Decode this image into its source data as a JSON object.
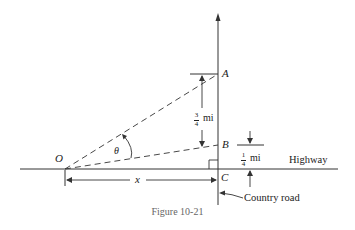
{
  "figure": {
    "caption": "Figure 10-21",
    "points": {
      "A": "A",
      "B": "B",
      "C": "C",
      "O": "O"
    },
    "angle_label": "θ",
    "distance_x_label": "x",
    "dist_AB": {
      "numerator": "3",
      "denominator": "4",
      "unit": "mi"
    },
    "dist_BC": {
      "numerator": "1",
      "denominator": "4",
      "unit": "mi"
    },
    "road_labels": {
      "highway": "Highway",
      "country_road": "Country road"
    },
    "colors": {
      "line": "#333333",
      "caption": "#666666"
    }
  }
}
